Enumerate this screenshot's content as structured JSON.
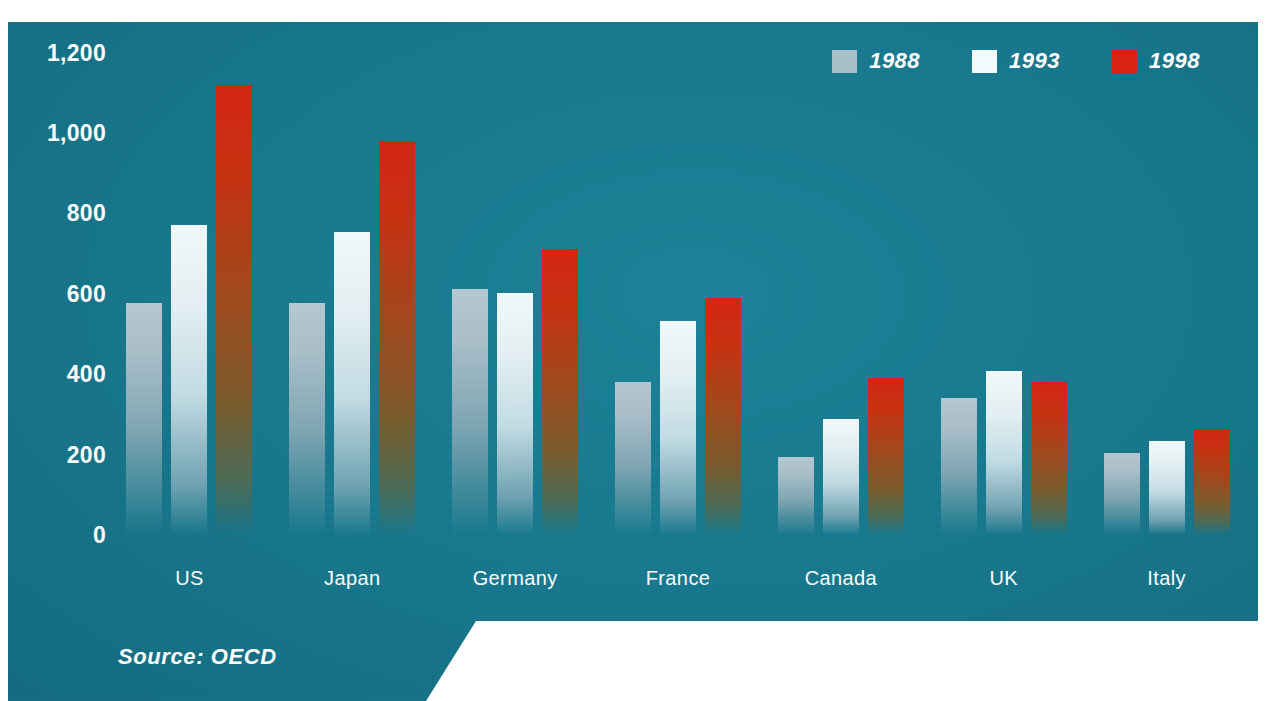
{
  "colors": {
    "panel_background": "#15778C",
    "page_background": "#FFFFFF",
    "series_1988": "#A9BFCA",
    "series_1993": "#F2FAFC",
    "series_1998": "#D62410",
    "text": "#FFFFFF"
  },
  "source_note": "Source: OECD",
  "legend": {
    "items": [
      {
        "label": "1988",
        "swatch": "#A9BFCA",
        "swatch_name": "legend-swatch-1988"
      },
      {
        "label": "1993",
        "swatch": "#F2FAFC",
        "swatch_name": "legend-swatch-1993"
      },
      {
        "label": "1998",
        "swatch": "#D62410",
        "swatch_name": "legend-swatch-1998"
      }
    ]
  },
  "chart_data": {
    "type": "bar",
    "title": "",
    "subtitle": "",
    "xlabel": "",
    "ylabel": "",
    "ylim": [
      0,
      1200
    ],
    "yticks": [
      "0",
      "200",
      "400",
      "600",
      "800",
      "1,000",
      "1,200"
    ],
    "ytick_values": [
      0,
      200,
      400,
      600,
      800,
      1000,
      1200
    ],
    "grid": false,
    "legend_position": "top-right",
    "categories": [
      "US",
      "Japan",
      "Germany",
      "France",
      "Canada",
      "UK",
      "Italy"
    ],
    "series": [
      {
        "name": "1988",
        "color": "#A9BFCA",
        "values": [
          578,
          578,
          612,
          380,
          195,
          340,
          205
        ]
      },
      {
        "name": "1993",
        "color": "#F2FAFC",
        "values": [
          772,
          755,
          602,
          533,
          290,
          408,
          233
        ]
      },
      {
        "name": "1998",
        "color": "#D62410",
        "values": [
          1120,
          980,
          712,
          590,
          392,
          382,
          265
        ]
      }
    ],
    "annotations": [
      "Source: OECD"
    ]
  }
}
